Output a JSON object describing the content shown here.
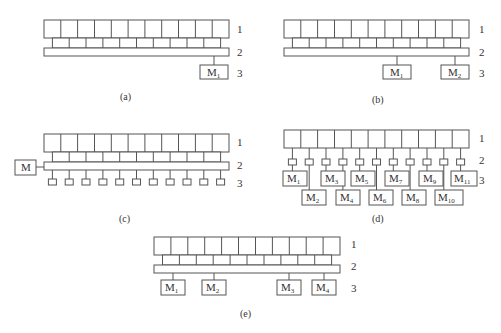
{
  "figure": {
    "panels": [
      {
        "id": "a",
        "caption": "(a)",
        "row_labels": [
          "1",
          "2",
          "3"
        ],
        "modules": [
          {
            "label": "M",
            "sub": "1"
          }
        ]
      },
      {
        "id": "b",
        "caption": "(b)",
        "row_labels": [
          "1",
          "2",
          "3"
        ],
        "modules": [
          {
            "label": "M",
            "sub": "1"
          },
          {
            "label": "M",
            "sub": "2"
          }
        ]
      },
      {
        "id": "c",
        "caption": "(c)",
        "row_labels": [
          "1",
          "2",
          "3"
        ],
        "side_module": {
          "label": "M"
        },
        "small_unit_count": 11
      },
      {
        "id": "d",
        "caption": "(d)",
        "row_labels": [
          "1",
          "2",
          "3"
        ],
        "modules": [
          {
            "label": "M",
            "sub": "1"
          },
          {
            "label": "M",
            "sub": "2"
          },
          {
            "label": "M",
            "sub": "3"
          },
          {
            "label": "M",
            "sub": "4"
          },
          {
            "label": "M",
            "sub": "5"
          },
          {
            "label": "M",
            "sub": "6"
          },
          {
            "label": "M",
            "sub": "7"
          },
          {
            "label": "M",
            "sub": "8"
          },
          {
            "label": "M",
            "sub": "9"
          },
          {
            "label": "M",
            "sub": "10"
          },
          {
            "label": "M",
            "sub": "11"
          }
        ]
      },
      {
        "id": "e",
        "caption": "(e)",
        "row_labels": [
          "1",
          "2",
          "3"
        ],
        "modules": [
          {
            "label": "M",
            "sub": "1"
          },
          {
            "label": "M",
            "sub": "2"
          },
          {
            "label": "M",
            "sub": "3"
          },
          {
            "label": "M",
            "sub": "4"
          }
        ]
      }
    ],
    "cells_per_row": 11
  }
}
